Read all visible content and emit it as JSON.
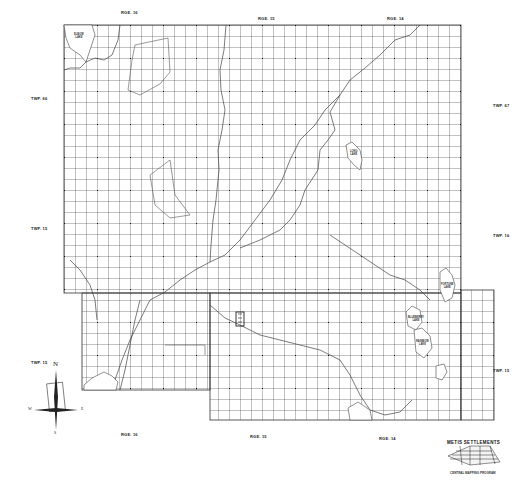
{
  "map": {
    "title": "Metis Settlements Survey Map",
    "range_labels_top": [
      {
        "text": "RGE. 16",
        "x": 121,
        "y": 10
      },
      {
        "text": "RGE. 15",
        "x": 258,
        "y": 16
      },
      {
        "text": "RGE. 14",
        "x": 387,
        "y": 16
      }
    ],
    "range_labels_bottom": [
      {
        "text": "RGE. 16",
        "x": 121,
        "y": 432
      },
      {
        "text": "RGE. 15",
        "x": 250,
        "y": 434
      },
      {
        "text": "RGE. 14",
        "x": 379,
        "y": 436
      }
    ],
    "township_labels_left": [
      {
        "text": "TWP. 66",
        "x": 31,
        "y": 96
      },
      {
        "text": "TWP. 15",
        "x": 31,
        "y": 226
      },
      {
        "text": "TWP. 15",
        "x": 31,
        "y": 360
      }
    ],
    "township_labels_right": [
      {
        "text": "TWP. 67",
        "x": 493,
        "y": 103
      },
      {
        "text": "TWP. 16",
        "x": 493,
        "y": 233
      },
      {
        "text": "TWP. 15",
        "x": 493,
        "y": 368
      }
    ],
    "lakes": [
      {
        "name": "ELBOW",
        "suffix": "LAKE",
        "x": 76,
        "y": 31
      },
      {
        "name": "LONG",
        "suffix": "LAKE",
        "x": 354,
        "y": 150
      },
      {
        "name": "FORTUNE",
        "suffix": "LAKE",
        "x": 446,
        "y": 283
      },
      {
        "name": "BLUEBERRY",
        "suffix": "LAKE",
        "x": 413,
        "y": 320
      },
      {
        "name": "RAINBOW",
        "suffix": "LAKE",
        "x": 420,
        "y": 340
      }
    ],
    "compass": {
      "n": "N",
      "s": "S",
      "e": "E",
      "w": "W"
    },
    "logo": {
      "title": "METIS SETTLEMENTS",
      "subtitle": "CENTRAL MAPPING PROGRAM"
    },
    "grid": {
      "cell_size": 11,
      "line_color": "#333333",
      "river_color": "#444444"
    }
  }
}
